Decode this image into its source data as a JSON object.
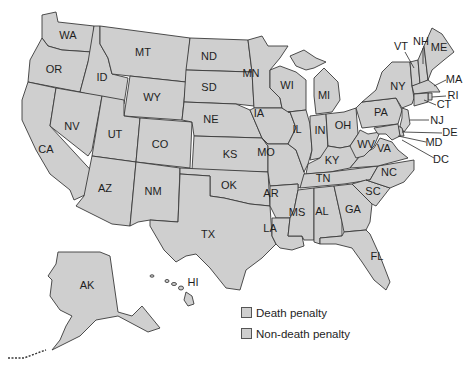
{
  "map": {
    "title": "",
    "fill_color": "#cfcfcf",
    "border_color": "#3a3a3a",
    "states": {
      "WA": "WA",
      "OR": "OR",
      "CA": "CA",
      "ID": "ID",
      "NV": "NV",
      "MT": "MT",
      "WY": "WY",
      "UT": "UT",
      "CO": "CO",
      "AZ": "AZ",
      "NM": "NM",
      "ND": "ND",
      "SD": "SD",
      "NE": "NE",
      "KS": "KS",
      "OK": "OK",
      "TX": "TX",
      "MN": "MN",
      "IA": "IA",
      "MO": "MO",
      "AR": "AR",
      "LA": "LA",
      "WI": "WI",
      "IL": "IL",
      "MI": "MI",
      "IN": "IN",
      "OH": "OH",
      "KY": "KY",
      "TN": "TN",
      "MS": "MS",
      "AL": "AL",
      "GA": "GA",
      "FL": "FL",
      "SC": "SC",
      "NC": "NC",
      "VA": "VA",
      "WV": "WV",
      "PA": "PA",
      "NY": "NY",
      "VT": "VT",
      "NH": "NH",
      "ME": "ME",
      "MA": "MA",
      "RI": "RI",
      "CT": "CT",
      "NJ": "NJ",
      "DE": "DE",
      "MD": "MD",
      "DC": "DC",
      "AK": "AK",
      "HI": "HI"
    }
  },
  "legend": {
    "items": [
      {
        "label": "Death penalty",
        "color": "#cfcfcf"
      },
      {
        "label": "Non-death penalty",
        "color": "#cfcfcf"
      }
    ]
  }
}
